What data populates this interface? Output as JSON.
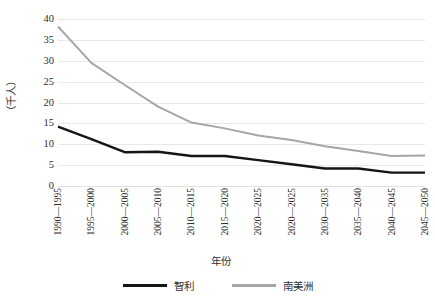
{
  "chart_data": {
    "type": "line",
    "title": "",
    "subtitle": "",
    "xlabel": "年份",
    "ylabel": "（千人）",
    "ylim": [
      0,
      40
    ],
    "yticks": [
      40,
      35,
      30,
      25,
      20,
      15,
      10,
      5,
      0
    ],
    "grid": true,
    "legend_position": "bottom",
    "categories": [
      "1990—1995",
      "1995—2000",
      "2000—2005",
      "2005—2010",
      "2010—2015",
      "2015—2020",
      "2020—2025",
      "2020—2025",
      "2030—2035",
      "2035—2040",
      "2040—2045",
      "2045—2050"
    ],
    "series": [
      {
        "name": "智利",
        "color": "#151515",
        "values": [
          14.2,
          11.2,
          8.1,
          8.2,
          7.2,
          7.2,
          6.2,
          5.2,
          4.2,
          4.2,
          3.2,
          3.2
        ]
      },
      {
        "name": "南美洲",
        "color": "#a6a6a6",
        "values": [
          38.2,
          29.5,
          24.2,
          19.0,
          15.2,
          13.8,
          12.1,
          11.0,
          9.5,
          8.4,
          7.2,
          7.3
        ]
      }
    ]
  },
  "legend": {
    "items": [
      {
        "label": "智利"
      },
      {
        "label": "南美洲"
      }
    ]
  },
  "colors": {
    "series_chile": "#151515",
    "series_south_america": "#a6a6a6",
    "gridline": "#e8e8e8",
    "text": "#2f2f2f",
    "background": "#ffffff"
  }
}
